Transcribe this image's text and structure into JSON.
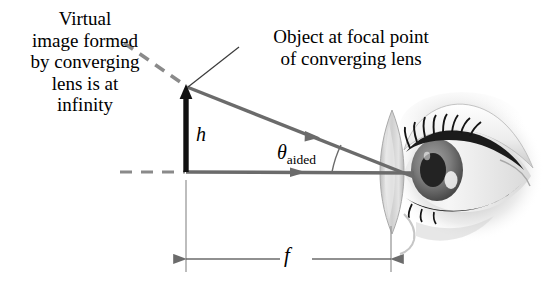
{
  "diagram": {
    "labels": {
      "virtual_image": "Virtual\nimage formed\nby converging\nlens is at\ninfinity",
      "object_focal_point": "Object at focal point\nof converging lens",
      "object_height": "h",
      "angle_symbol": "θ",
      "angle_subscript": "aided",
      "focal_length": "f"
    },
    "colors": {
      "text": "#000000",
      "ray": "#6b6b6b",
      "dashed": "#8a8a8a",
      "object_arrow": "#111111",
      "dimension": "#6b6b6b",
      "leader": "#3a3a3a",
      "eye_dark": "#1c1c1c",
      "eye_mid": "#8e8e8e",
      "eye_light": "#d8d8d8",
      "lens_fill": "#d6d6d6"
    },
    "geometry": {
      "object_x": 186,
      "axis_y": 172,
      "arrow_tip_y": 86,
      "lens_center_x": 392,
      "lens_top_y": 110,
      "lens_bottom_y": 234,
      "focal_length_px": 206
    }
  }
}
